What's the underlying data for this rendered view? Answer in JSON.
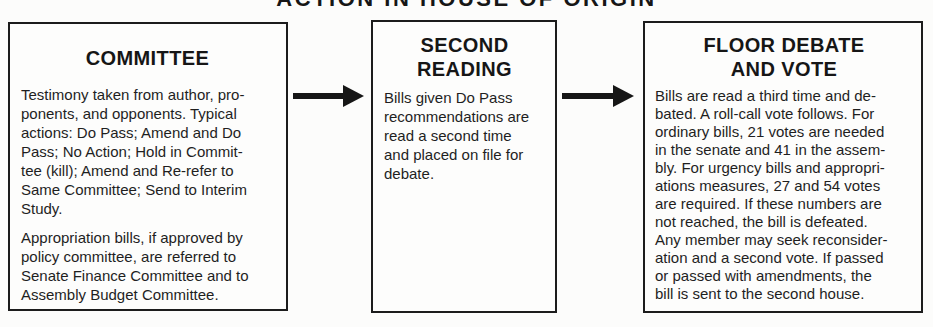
{
  "title": "ACTION IN HOUSE OF ORIGIN",
  "flow": {
    "boxes": [
      {
        "id": "committee",
        "heading": "COMMITTEE",
        "paragraphs": [
          "Testimony taken from author, pro-\nponents, and opponents. Typical\nactions: Do Pass; Amend and Do\nPass; No Action; Hold in Commit-\ntee (kill); Amend and Re-refer to\nSame Committee; Send to Interim\nStudy.",
          "Appropriation bills, if approved by\npolicy committee, are referred to\nSenate Finance Committee and to\nAssembly Budget Committee."
        ]
      },
      {
        "id": "second-reading",
        "heading": "SECOND\nREADING",
        "paragraphs": [
          "Bills given Do Pass\nrecommendations are\nread a second time\nand placed on file for\ndebate."
        ]
      },
      {
        "id": "floor-debate-and-vote",
        "heading": "FLOOR DEBATE\nAND VOTE",
        "paragraphs": [
          "Bills are read a third time and de-\nbated. A roll-call vote follows. For\nordinary bills, 21 votes are needed\nin the senate and 41 in the assem-\nbly. For urgency bills and appropri-\nations measures, 27 and 54 votes\nare required. If these numbers are\nnot reached, the bill is defeated.\nAny member may seek reconsider-\nation and a second vote. If passed\nor passed with amendments, the\nbill is sent to the second house."
        ]
      }
    ],
    "arrow_count": 2
  },
  "colors": {
    "ink": "#1c1c1c",
    "paper": "#fcfcfb",
    "border": "#1c1c1c"
  }
}
